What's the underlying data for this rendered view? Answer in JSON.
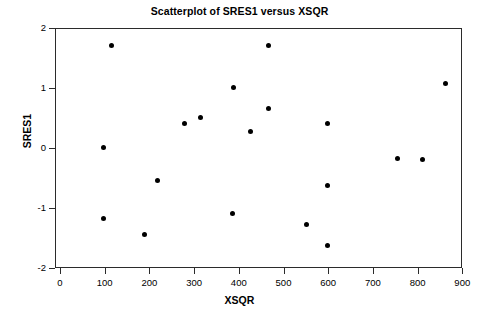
{
  "chart_data": {
    "type": "scatter",
    "title": "Scatterplot of SRES1 versus XSQR",
    "xlabel": "XSQR",
    "ylabel": "SRES1",
    "xlim": [
      -20,
      930
    ],
    "ylim": [
      -2,
      2
    ],
    "grid": false,
    "legend": null,
    "xticks": [
      0,
      100,
      200,
      300,
      400,
      500,
      600,
      700,
      800,
      900
    ],
    "xtick_labels": [
      "0",
      "100",
      "200",
      "300",
      "400",
      "500",
      "600",
      "700",
      "800",
      "900"
    ],
    "yticks": [
      -2,
      -1,
      0,
      1,
      2
    ],
    "ytick_labels": [
      "-2",
      "-1",
      "0",
      "1",
      "2"
    ],
    "marker": "filled-circle",
    "marker_color": "#000000",
    "point_count": 19,
    "points": [
      {
        "x": 96,
        "y": 0.02
      },
      {
        "x": 96,
        "y": -1.15
      },
      {
        "x": 114,
        "y": 1.72
      },
      {
        "x": 186,
        "y": -1.43
      },
      {
        "x": 217,
        "y": -0.53
      },
      {
        "x": 277,
        "y": 0.43
      },
      {
        "x": 313,
        "y": 0.53
      },
      {
        "x": 383,
        "y": -1.08
      },
      {
        "x": 385,
        "y": 1.02
      },
      {
        "x": 423,
        "y": 0.3
      },
      {
        "x": 465,
        "y": 1.72
      },
      {
        "x": 465,
        "y": 0.68
      },
      {
        "x": 550,
        "y": -1.25
      },
      {
        "x": 597,
        "y": 0.43
      },
      {
        "x": 597,
        "y": -0.6
      },
      {
        "x": 597,
        "y": -1.6
      },
      {
        "x": 752,
        "y": -0.15
      },
      {
        "x": 808,
        "y": -0.18
      },
      {
        "x": 861,
        "y": 1.1
      }
    ]
  },
  "figure": {
    "background_color": "#ffffff",
    "frame_color": "#2b2b2b"
  }
}
